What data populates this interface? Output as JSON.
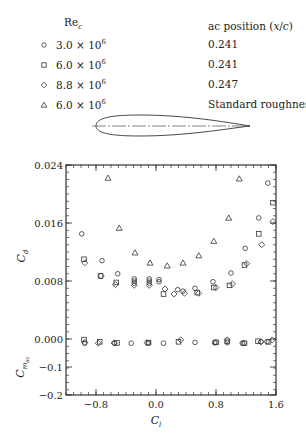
{
  "legend": {
    "re_header": "Re",
    "re_header_sub": "c",
    "ac_header": "ac position (x/c)",
    "rows": [
      {
        "marker": "circle",
        "re": "3.0 × 10",
        "exp": "6",
        "ac": "0.241"
      },
      {
        "marker": "square",
        "re": "6.0 × 10",
        "exp": "6",
        "ac": "0.241"
      },
      {
        "marker": "diamond",
        "re": "8.8 × 10",
        "exp": "6",
        "ac": "0.247"
      },
      {
        "marker": "triangle",
        "re": "6.0 × 10",
        "exp": "6",
        "ac": "Standard roughness"
      }
    ]
  },
  "chart_data": [
    {
      "type": "scatter",
      "title": "",
      "xlabel": "C_l",
      "ylabel": "C_d",
      "xlim": [
        -1.2,
        1.6
      ],
      "ylim": [
        0.0,
        0.024
      ],
      "yticks": [
        "0.000",
        "0.008",
        "0.016",
        "0.024"
      ],
      "grid": false,
      "series": [
        {
          "name": "Re_c = 3.0e6",
          "marker": "circle",
          "x": [
            -0.99,
            -0.72,
            -0.51,
            -0.29,
            -0.29,
            -0.29,
            -0.09,
            -0.09,
            -0.09,
            0.04,
            0.04,
            0.29,
            0.36,
            0.52,
            0.76,
            1.0,
            1.19,
            1.37,
            1.49
          ],
          "y": [
            0.0145,
            0.0108,
            0.009,
            0.0083,
            0.008,
            0.0077,
            0.0083,
            0.008,
            0.0077,
            0.0082,
            0.0079,
            0.0068,
            0.0066,
            0.007,
            0.0079,
            0.0091,
            0.0125,
            0.0167,
            0.0215
          ]
        },
        {
          "name": "Re_c = 6.0e6",
          "marker": "square",
          "x": [
            -0.96,
            -0.74,
            -0.53,
            0.1,
            0.55,
            0.77,
            0.98,
            1.18,
            1.37,
            1.56
          ],
          "y": [
            0.011,
            0.0087,
            0.0078,
            0.0062,
            0.0064,
            0.0071,
            0.0074,
            0.0102,
            0.0145,
            0.0188
          ]
        },
        {
          "name": "Re_c = 8.8e6",
          "marker": "diamond",
          "x": [
            -0.95,
            -0.73,
            -0.54,
            -0.29,
            -0.09,
            0.12,
            0.24,
            0.38,
            0.57,
            0.8,
            1.02,
            1.21,
            1.41,
            1.56
          ],
          "y": [
            0.0105,
            0.0087,
            0.0075,
            0.0074,
            0.0074,
            0.0069,
            0.0062,
            0.0063,
            0.0063,
            0.0071,
            0.0076,
            0.0104,
            0.013,
            0.0162
          ]
        },
        {
          "name": "Re_c = 6.0e6 standard roughness",
          "marker": "triangle",
          "x": [
            -0.64,
            -0.49,
            -0.28,
            -0.08,
            0.15,
            0.36,
            0.57,
            0.77,
            0.97,
            1.11
          ],
          "y": [
            0.0222,
            0.0153,
            0.0119,
            0.0105,
            0.0101,
            0.0105,
            0.0115,
            0.0135,
            0.0167,
            0.0221
          ]
        }
      ]
    },
    {
      "type": "scatter",
      "title": "",
      "xlabel": "C_l",
      "ylabel": "C_m_ac",
      "xlim": [
        -1.2,
        1.6
      ],
      "ylim": [
        -0.2,
        0.05
      ],
      "xticks": [
        "-0.8",
        "0.0",
        "0.8",
        "1.6"
      ],
      "yticks": [
        "-0.2",
        "-0.1",
        "0.000"
      ],
      "grid": false,
      "series": [
        {
          "name": "Re_c = 3.0e6",
          "marker": "circle",
          "x": [
            -0.95,
            -0.55,
            -0.33,
            -0.1,
            0.1,
            0.52,
            0.78,
            0.95,
            1.15,
            1.4,
            1.48
          ],
          "y": [
            -0.015,
            -0.015,
            -0.015,
            -0.015,
            -0.015,
            -0.012,
            -0.013,
            -0.013,
            -0.015,
            -0.01,
            -0.01
          ]
        },
        {
          "name": "Re_c = 6.0e6",
          "marker": "square",
          "x": [
            -0.96,
            -0.75,
            -0.52,
            -0.1,
            0.3,
            0.8,
            0.95,
            1.18,
            1.36,
            1.5
          ],
          "y": [
            -0.002,
            -0.01,
            -0.014,
            -0.013,
            -0.01,
            -0.012,
            -0.008,
            -0.015,
            -0.008,
            -0.01
          ]
        },
        {
          "name": "Re_c = 8.8e6",
          "marker": "diamond",
          "x": [
            -0.95,
            -0.77,
            -0.56,
            -0.12,
            0.33,
            0.8,
            0.95,
            1.17,
            1.4,
            1.55
          ],
          "y": [
            -0.012,
            -0.015,
            -0.014,
            -0.013,
            -0.003,
            -0.012,
            -0.003,
            -0.015,
            -0.01,
            -0.003
          ]
        }
      ]
    }
  ],
  "axes": {
    "cd_label": "C",
    "cd_label_sub": "d",
    "cm_label": "C",
    "cm_label_sub": "m",
    "cm_label_subsub": "ac",
    "x_label": "C",
    "x_label_sub": "l"
  },
  "airfoil": {
    "label": "airfoil-section"
  }
}
